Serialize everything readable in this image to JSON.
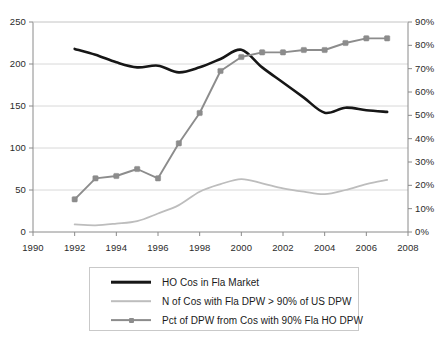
{
  "chart_data": {
    "type": "line",
    "title": "",
    "xlabel": "",
    "ylabel": "",
    "grid": true,
    "legend_position": "bottom",
    "x": [
      1992,
      1993,
      1994,
      1995,
      1996,
      1997,
      1998,
      1999,
      2000,
      2001,
      2002,
      2003,
      2004,
      2005,
      2006,
      2007
    ],
    "x_axis": {
      "ticks": [
        "1990",
        "1992",
        "1994",
        "1996",
        "1998",
        "2000",
        "2002",
        "2004",
        "2006",
        "2008"
      ],
      "tick_values": [
        1990,
        1992,
        1994,
        1996,
        1998,
        2000,
        2002,
        2004,
        2006,
        2008
      ],
      "xlim": [
        1990,
        2008
      ]
    },
    "y_axis_left": {
      "ticks": [
        "0",
        "50",
        "100",
        "150",
        "200",
        "250"
      ],
      "tick_values": [
        0,
        50,
        100,
        150,
        200,
        250
      ],
      "ylim": [
        0,
        250
      ]
    },
    "y_axis_right": {
      "ticks": [
        "0%",
        "10%",
        "20%",
        "30%",
        "40%",
        "50%",
        "60%",
        "70%",
        "80%",
        "90%"
      ],
      "tick_values": [
        0,
        10,
        20,
        30,
        40,
        50,
        60,
        70,
        80,
        90
      ],
      "ylim": [
        0,
        90
      ]
    },
    "series": [
      {
        "name": "HO Cos in Fla Market",
        "axis": "left",
        "color": "#161616",
        "width": 2.6,
        "markers": false,
        "values": [
          218,
          211,
          202,
          196,
          198,
          190,
          196,
          206,
          217,
          196,
          178,
          160,
          142,
          148,
          145,
          143
        ]
      },
      {
        "name": "N of Cos with Fla DPW > 90% of US DPW",
        "axis": "left",
        "color": "#bdbdbd",
        "width": 1.8,
        "markers": false,
        "values": [
          9,
          8,
          10,
          13,
          22,
          32,
          48,
          57,
          63,
          58,
          52,
          48,
          45,
          50,
          57,
          62
        ]
      },
      {
        "name": "Pct of DPW from Cos with 90% Fla HO DPW",
        "axis": "right",
        "color": "#8c8c8c",
        "width": 1.9,
        "markers": true,
        "values": [
          14,
          23,
          24,
          27,
          23,
          38,
          51,
          69,
          75,
          77,
          77,
          78,
          78,
          81,
          83,
          83
        ]
      }
    ]
  },
  "legend": {
    "items": [
      {
        "label": "HO Cos in Fla Market",
        "style": "black-line"
      },
      {
        "label": "N of Cos with Fla DPW > 90% of US DPW",
        "style": "light-line"
      },
      {
        "label": "Pct of DPW from Cos with 90% Fla HO DPW",
        "style": "marker-line"
      }
    ]
  },
  "colors": {
    "series_black": "#161616",
    "series_light_grey": "#bdbdbd",
    "series_marker_grey": "#8c8c8c",
    "gridline": "#d8d8d8",
    "axis": "#8a8a8a",
    "text": "#1a1a1a",
    "background": "#ffffff"
  }
}
